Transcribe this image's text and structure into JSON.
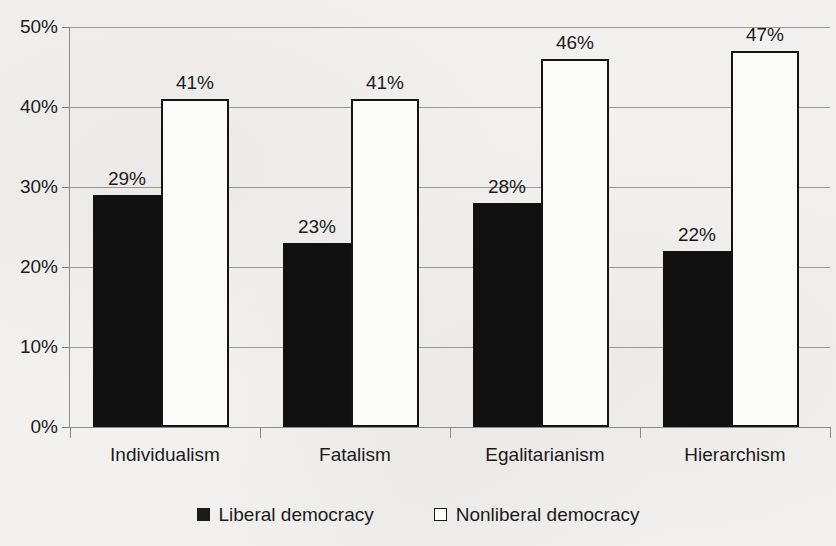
{
  "chart_data": {
    "type": "bar",
    "title": "",
    "subtitle": "",
    "xlabel": "",
    "ylabel": "",
    "categories": [
      "Individualism",
      "Fatalism",
      "Egalitarianism",
      "Hierarchism"
    ],
    "series": [
      {
        "name": "Liberal democracy",
        "values": [
          29,
          23,
          28,
          22
        ],
        "value_labels": [
          "29%",
          "23%",
          "28%",
          "22%"
        ],
        "fill": "#111111",
        "stroke": "#111111",
        "swatch": "filled-black-square"
      },
      {
        "name": "Nonliberal democracy",
        "values": [
          41,
          41,
          46,
          47
        ],
        "value_labels": [
          "41%",
          "41%",
          "46%",
          "47%"
        ],
        "fill": "#fbfbfa",
        "stroke": "#141414",
        "swatch": "outlined-white-square"
      }
    ],
    "ylim": [
      0,
      50
    ],
    "y_ticks": [
      0,
      10,
      20,
      30,
      40,
      50
    ],
    "y_tick_labels": [
      "0%",
      "10%",
      "20%",
      "30%",
      "40%",
      "50%"
    ],
    "grid": true,
    "grid_axis": "y",
    "legend_position": "bottom-center",
    "data_labels": true,
    "units": "percent"
  },
  "legend": {
    "items": [
      {
        "label": "Liberal democracy",
        "swatch": "filled-black-square"
      },
      {
        "label": "Nonliberal democracy",
        "swatch": "outlined-white-square"
      }
    ]
  },
  "colors": {
    "background": "#f2f1ef",
    "liberal_bar": "#111111",
    "nonliberal_bar": "#fbfbfa",
    "bar_outline": "#141414",
    "gridline": "#9a9a9a",
    "axis": "#8c8c8c",
    "text": "#1b1b1b"
  }
}
